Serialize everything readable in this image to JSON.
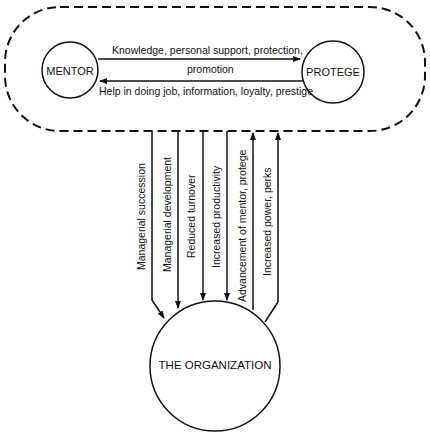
{
  "diagram": {
    "nodes": {
      "mentor": {
        "label": "MENTOR"
      },
      "protege": {
        "label": "PROTEGE"
      },
      "organization": {
        "label": "THE ORGANIZATION"
      }
    },
    "horizontal_flows": {
      "mentor_to_protege": {
        "line1": "Knowledge, personal support, protection,",
        "line2": "promotion"
      },
      "protege_to_mentor": {
        "label": "Help in doing job, information, loyalty, prestige"
      }
    },
    "vertical_flows": [
      {
        "label": "Managerial succession",
        "direction": "to-organization"
      },
      {
        "label": "Managerial development",
        "direction": "to-organization"
      },
      {
        "label": "Reduced turnover",
        "direction": "to-organization"
      },
      {
        "label": "Increased productivity",
        "direction": "to-organization"
      },
      {
        "label": "Advancement of mentor, protege",
        "direction": "to-dyad"
      },
      {
        "label": "Increased power, perks",
        "direction": "to-dyad"
      }
    ],
    "colors": {
      "stroke": "#111111",
      "background": "#ffffff"
    }
  }
}
